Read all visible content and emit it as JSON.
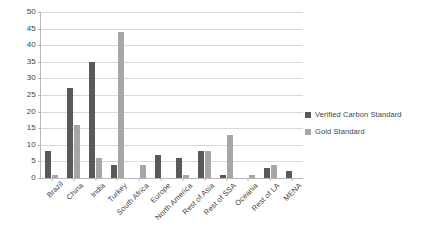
{
  "chart_data": {
    "type": "bar",
    "title": "",
    "xlabel": "",
    "ylabel": "",
    "ylim": [
      0,
      50
    ],
    "ytick_step": 5,
    "yticks": [
      50,
      45,
      40,
      35,
      30,
      25,
      20,
      15,
      10,
      5,
      0
    ],
    "grid": true,
    "legend_position": "right",
    "categories": [
      "Brazil",
      "China",
      "India",
      "Turkey",
      "South Africa",
      "Europe",
      "North America",
      "Rest of Asia",
      "Rest of SSA",
      "Oceania",
      "Rest of LA",
      "MENA"
    ],
    "series": [
      {
        "name": "Verified Carbon Standard",
        "color": "#595959",
        "values": [
          8,
          27,
          35,
          4,
          0,
          7,
          6,
          8,
          1,
          0,
          3,
          2
        ]
      },
      {
        "name": "Gold Standard",
        "color": "#a6a6a6",
        "values": [
          1,
          16,
          6,
          44,
          4,
          0,
          1,
          8,
          13,
          1,
          4,
          0
        ]
      }
    ]
  },
  "legend": {
    "items": [
      {
        "label": "Verified Carbon Standard",
        "swatch": "#595959"
      },
      {
        "label": "Gold Standard",
        "swatch": "#a6a6a6"
      }
    ]
  },
  "colors": {
    "series_dark": "#595959",
    "series_light": "#a6a6a6",
    "gridline": "#d9d9d9",
    "axis": "#b8b8b8",
    "text": "#3f3f3f",
    "background": "#ffffff"
  }
}
